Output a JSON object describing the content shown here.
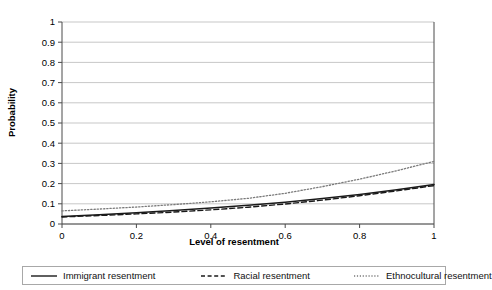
{
  "chart_data": {
    "type": "line",
    "title": "",
    "xlabel": "Level of resentment",
    "ylabel": "Probability",
    "xlim": [
      0,
      1
    ],
    "ylim": [
      0,
      1
    ],
    "xticks": [
      "0",
      "0.2",
      "0.4",
      "0.6",
      "0.8",
      "1"
    ],
    "xtick_values": [
      0,
      0.2,
      0.4,
      0.6,
      0.8,
      1
    ],
    "yticks": [
      "0",
      "0.1",
      "0.2",
      "0.3",
      "0.4",
      "0.5",
      "0.6",
      "0.7",
      "0.8",
      "0.9",
      "1"
    ],
    "ytick_values": [
      0,
      0.1,
      0.2,
      0.3,
      0.4,
      0.5,
      0.6,
      0.7,
      0.8,
      0.9,
      1
    ],
    "grid": "horizontal",
    "legend_position": "bottom",
    "x": [
      0,
      0.1,
      0.2,
      0.3,
      0.4,
      0.5,
      0.6,
      0.7,
      0.8,
      0.9,
      1
    ],
    "series": [
      {
        "name": "Immigrant resentment",
        "style": "solid",
        "color": "#1a1a1a",
        "values": [
          0.037,
          0.046,
          0.056,
          0.067,
          0.079,
          0.093,
          0.108,
          0.126,
          0.146,
          0.169,
          0.195
        ]
      },
      {
        "name": "Racial resentment",
        "style": "dashed",
        "color": "#1a1a1a",
        "values": [
          0.035,
          0.042,
          0.05,
          0.059,
          0.07,
          0.083,
          0.099,
          0.118,
          0.14,
          0.164,
          0.19
        ]
      },
      {
        "name": "Ethnocultural resentment",
        "style": "dotted",
        "color": "#7a7a7a",
        "values": [
          0.065,
          0.074,
          0.084,
          0.096,
          0.11,
          0.127,
          0.152,
          0.185,
          0.222,
          0.264,
          0.31
        ]
      }
    ]
  },
  "legend": {
    "entries": [
      {
        "label": "Immigrant resentment"
      },
      {
        "label": "Racial resentment"
      },
      {
        "label": "Ethnocultural resentment"
      }
    ]
  },
  "axes": {
    "x_title": "Level of resentment",
    "y_title": "Probability"
  }
}
